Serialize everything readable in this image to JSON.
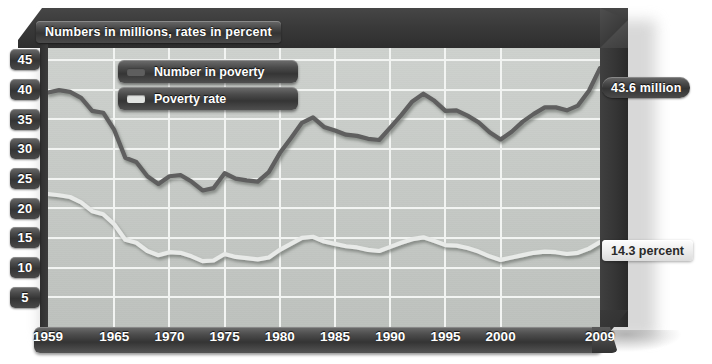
{
  "chart_data": {
    "type": "line",
    "title": "Numbers in millions, rates in percent",
    "xlabel": "",
    "ylabel": "",
    "xlim": [
      1959,
      2009
    ],
    "ylim": [
      0,
      47
    ],
    "grid": true,
    "legend_position": "top-center",
    "x_ticks": [
      "1959",
      "1965",
      "1970",
      "1975",
      "1980",
      "1985",
      "1990",
      "1995",
      "2000",
      "2009"
    ],
    "y_ticks": [
      "45",
      "40",
      "35",
      "30",
      "25",
      "20",
      "15",
      "10",
      "5"
    ],
    "series": [
      {
        "name": "Number in poverty",
        "color": "#5e5e5e",
        "unit": "millions",
        "end_label": "43.6 million",
        "x": [
          1959,
          1960,
          1961,
          1962,
          1963,
          1964,
          1965,
          1966,
          1967,
          1968,
          1969,
          1970,
          1971,
          1972,
          1973,
          1974,
          1975,
          1976,
          1977,
          1978,
          1979,
          1980,
          1981,
          1982,
          1983,
          1984,
          1985,
          1986,
          1987,
          1988,
          1989,
          1990,
          1991,
          1992,
          1993,
          1994,
          1995,
          1996,
          1997,
          1998,
          1999,
          2000,
          2001,
          2002,
          2003,
          2004,
          2005,
          2006,
          2007,
          2008,
          2009
        ],
        "values": [
          39.5,
          39.9,
          39.6,
          38.6,
          36.4,
          36.1,
          33.2,
          28.5,
          27.8,
          25.4,
          24.1,
          25.4,
          25.6,
          24.5,
          23.0,
          23.4,
          25.9,
          25.0,
          24.7,
          24.5,
          26.1,
          29.3,
          31.8,
          34.4,
          35.3,
          33.7,
          33.1,
          32.4,
          32.2,
          31.7,
          31.5,
          33.6,
          35.7,
          38.0,
          39.3,
          38.1,
          36.4,
          36.5,
          35.6,
          34.5,
          32.8,
          31.6,
          32.9,
          34.6,
          35.9,
          37.0,
          37.0,
          36.5,
          37.3,
          39.8,
          43.6
        ]
      },
      {
        "name": "Poverty rate",
        "color": "#e8eae8",
        "unit": "percent",
        "end_label": "14.3 percent",
        "x": [
          1959,
          1960,
          1961,
          1962,
          1963,
          1964,
          1965,
          1966,
          1967,
          1968,
          1969,
          1970,
          1971,
          1972,
          1973,
          1974,
          1975,
          1976,
          1977,
          1978,
          1979,
          1980,
          1981,
          1982,
          1983,
          1984,
          1985,
          1986,
          1987,
          1988,
          1989,
          1990,
          1991,
          1992,
          1993,
          1994,
          1995,
          1996,
          1997,
          1998,
          1999,
          2000,
          2001,
          2002,
          2003,
          2004,
          2005,
          2006,
          2007,
          2008,
          2009
        ],
        "values": [
          22.4,
          22.2,
          21.9,
          21.0,
          19.5,
          19.0,
          17.3,
          14.7,
          14.2,
          12.8,
          12.1,
          12.6,
          12.5,
          11.9,
          11.1,
          11.2,
          12.3,
          11.8,
          11.6,
          11.4,
          11.7,
          13.0,
          14.0,
          15.0,
          15.2,
          14.4,
          14.0,
          13.6,
          13.4,
          13.0,
          12.8,
          13.5,
          14.2,
          14.8,
          15.1,
          14.5,
          13.8,
          13.7,
          13.3,
          12.7,
          11.9,
          11.3,
          11.7,
          12.1,
          12.5,
          12.7,
          12.6,
          12.3,
          12.5,
          13.2,
          14.3
        ]
      }
    ]
  },
  "title": {
    "text": "Numbers in millions, rates in percent"
  },
  "legend": {
    "items": [
      {
        "label": "Number in poverty",
        "swatch_color": "#5e5e5e"
      },
      {
        "label": "Poverty rate",
        "swatch_color": "#e2e4e2"
      }
    ]
  },
  "callouts": {
    "number_in_poverty": "43.6 million",
    "poverty_rate": "14.3 percent"
  },
  "colors": {
    "frame": "#3a3a3a",
    "plot_background": "#c8ccc8",
    "gridline": "#f2f4f2",
    "number_line": "#5e5e5e",
    "rate_line": "#e8eae8"
  }
}
